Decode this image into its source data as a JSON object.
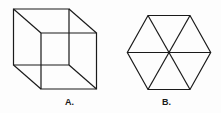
{
  "figures": [
    {
      "id": "A",
      "label": "A.",
      "shape": "wireframe-cube",
      "back_square": [
        [
          13.5,
          9
        ],
        [
          69,
          9
        ],
        [
          69,
          65
        ],
        [
          13.5,
          65
        ]
      ],
      "front_square": [
        [
          41,
          33
        ],
        [
          96.5,
          33
        ],
        [
          96.5,
          89
        ],
        [
          41,
          89
        ]
      ]
    },
    {
      "id": "B",
      "label": "B.",
      "shape": "hexagon-with-diagonals",
      "center": [
        169,
        52.5
      ],
      "vertices": [
        [
          148,
          15.5
        ],
        [
          190,
          15.5
        ],
        [
          210.7,
          52.5
        ],
        [
          190,
          89.5
        ],
        [
          148,
          89.5
        ],
        [
          127.3,
          52.5
        ]
      ]
    }
  ],
  "colors": {
    "stroke": "#1a1a1a",
    "background": "#fdfdfd"
  }
}
